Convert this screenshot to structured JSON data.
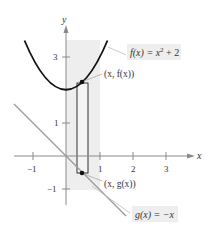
{
  "figure": {
    "axes": {
      "x_label": "x",
      "y_label": "y",
      "x_ticks": [
        {
          "value": -1,
          "label": "−1"
        },
        {
          "value": 1,
          "label": "1"
        },
        {
          "value": 2,
          "label": "2"
        },
        {
          "value": 3,
          "label": "3"
        }
      ],
      "y_ticks": [
        {
          "value": 3,
          "label": "3"
        },
        {
          "value": 1,
          "label": "1"
        },
        {
          "value": -1,
          "label": "−1"
        }
      ],
      "x_range": [
        -1.5,
        3.9
      ],
      "y_range": [
        -1.5,
        4
      ]
    },
    "functions": {
      "f": {
        "label_lhs": "f(x) = x",
        "label_exp": "2",
        "label_rhs": " + 2",
        "expression": "x^2 + 2",
        "color": "#111111"
      },
      "g": {
        "label": "g(x) = −x",
        "expression": "-x",
        "color": "#999999"
      }
    },
    "points": {
      "top": {
        "label": "(x, f(x))",
        "x": 0.5,
        "y": 2.25
      },
      "bottom": {
        "label": "(x, g(x))",
        "x": 0.5,
        "y": -0.5
      }
    },
    "rectangle": {
      "x_left": 0.33,
      "x_right": 0.67
    },
    "shaded_region": {
      "x_from": 0,
      "x_to": 1,
      "color": "#ececec"
    },
    "colors": {
      "axis": "#8a8a8a",
      "label_box": "#eeeeee",
      "leader": "#aaaaaa"
    }
  }
}
